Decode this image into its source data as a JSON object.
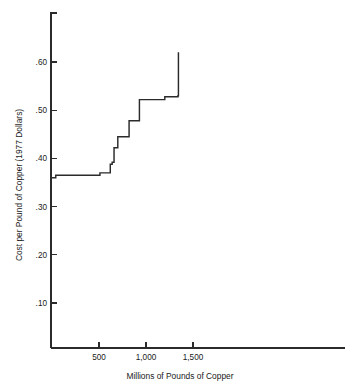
{
  "chart_data": {
    "type": "line",
    "subtype": "step-supply-curve",
    "title": "",
    "xlabel": "Millions of Pounds of Copper",
    "ylabel": "Cost per Pound of Copper (1977 Dollars)",
    "xlim": [
      -10,
      2150
    ],
    "ylim": [
      0.0,
      0.665
    ],
    "grid": false,
    "legend": null,
    "x_ticks": [
      500,
      1000,
      1500
    ],
    "x_tick_labels": [
      "500",
      "1,000",
      "1,500"
    ],
    "y_ticks": [
      0.1,
      0.2,
      0.3,
      0.4,
      0.5,
      0.6
    ],
    "y_tick_labels": [
      ".10",
      ".20",
      ".30",
      ".40",
      ".50",
      ".60"
    ],
    "series": [
      {
        "name": "Copper supply step function",
        "step_type": "post",
        "x": [
          0,
          40,
          510,
          620,
          640,
          660,
          700,
          820,
          930,
          1200,
          1340,
          1345
        ],
        "y": [
          0.36,
          0.365,
          0.37,
          0.388,
          0.392,
          0.422,
          0.445,
          0.478,
          0.522,
          0.528,
          0.53,
          0.62
        ]
      }
    ],
    "points": [
      {
        "x": 0,
        "y": 0.36
      },
      {
        "x": 40,
        "y": 0.365
      },
      {
        "x": 510,
        "y": 0.37
      },
      {
        "x": 620,
        "y": 0.388
      },
      {
        "x": 640,
        "y": 0.392
      },
      {
        "x": 660,
        "y": 0.422
      },
      {
        "x": 700,
        "y": 0.445
      },
      {
        "x": 820,
        "y": 0.478
      },
      {
        "x": 930,
        "y": 0.522
      },
      {
        "x": 1200,
        "y": 0.528
      },
      {
        "x": 1340,
        "y": 0.53
      },
      {
        "x": 1345,
        "y": 0.62
      }
    ],
    "colors": {
      "curve": "#2b2b2b",
      "axis": "#2b2b2b",
      "background": "#ffffff"
    }
  }
}
